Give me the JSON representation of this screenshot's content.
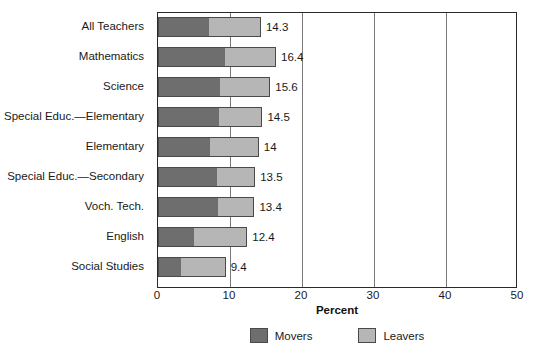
{
  "chart_data": {
    "type": "bar",
    "orientation": "horizontal",
    "stacked": true,
    "title": "",
    "xlabel": "Percent",
    "ylabel": "",
    "xlim": [
      0,
      50
    ],
    "xticks": [
      0,
      10,
      20,
      30,
      40,
      50
    ],
    "grid": true,
    "legend_position": "bottom",
    "categories": [
      "All Teachers",
      "Mathematics",
      "Science",
      "Special Educ.—Elementary",
      "Elementary",
      "Special Educ.—Secondary",
      "Voch. Tech.",
      "English",
      "Social Studies"
    ],
    "series": [
      {
        "name": "Movers",
        "color": "#6e6e6e",
        "values": [
          7.1,
          9.3,
          8.6,
          8.5,
          7.2,
          8.2,
          8.4,
          5.0,
          3.2
        ]
      },
      {
        "name": "Leavers",
        "color": "#b6b6b6",
        "values": [
          7.2,
          7.1,
          7.0,
          6.0,
          6.8,
          5.3,
          5.0,
          7.4,
          6.2
        ]
      }
    ],
    "totals": [
      14.3,
      16.4,
      15.6,
      14.5,
      14,
      13.5,
      13.4,
      12.4,
      9.4
    ],
    "total_labels": [
      "14.3",
      "16.4",
      "15.6",
      "14.5",
      "14",
      "13.5",
      "13.4",
      "12.4",
      "9.4"
    ],
    "tick_labels": [
      "0",
      "10",
      "20",
      "30",
      "40",
      "50"
    ],
    "legend": [
      {
        "label": "Movers",
        "color": "#6e6e6e"
      },
      {
        "label": "Leavers",
        "color": "#b6b6b6"
      }
    ]
  }
}
